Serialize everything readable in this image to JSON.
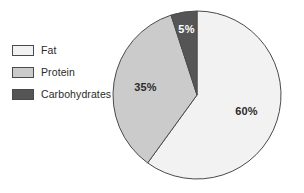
{
  "chart_data": {
    "type": "pie",
    "title": "",
    "subtitle": "",
    "xlabel": "",
    "ylabel": "",
    "grid": false,
    "legend_position": "left",
    "start_angle_deg": 0,
    "direction": "clockwise",
    "categories": [
      "Fat",
      "Protein",
      "Carbohydrates"
    ],
    "values": [
      60,
      35,
      5
    ],
    "value_unit": "%",
    "data_labels": [
      "60%",
      "35%",
      "5%"
    ],
    "colors": [
      "#f2f2f2",
      "#cbcbcb",
      "#555555"
    ],
    "slices": [
      {
        "name": "Fat",
        "value": 60,
        "label": "60%",
        "color": "#f2f2f2",
        "label_color": "#2b2b2b",
        "start_deg": 0,
        "end_deg": 216
      },
      {
        "name": "Protein",
        "value": 35,
        "label": "35%",
        "color": "#cbcbcb",
        "label_color": "#2b2b2b",
        "start_deg": 216,
        "end_deg": 342
      },
      {
        "name": "Carbohydrates",
        "value": 5,
        "label": "5%",
        "color": "#555555",
        "label_color": "#ffffff",
        "start_deg": 342,
        "end_deg": 360
      }
    ],
    "outline_color": "#4a4a4a"
  },
  "legend": {
    "items": [
      {
        "label": "Fat",
        "color": "#f2f2f2"
      },
      {
        "label": "Protein",
        "color": "#cbcbcb"
      },
      {
        "label": "Carbohydrates",
        "color": "#555555"
      }
    ]
  },
  "geometry": {
    "center_x": 85,
    "center_y": 85,
    "radius": 84,
    "label_radius_ratio": 0.62
  }
}
